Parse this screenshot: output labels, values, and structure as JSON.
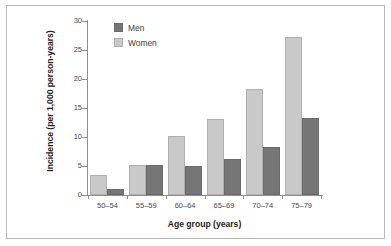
{
  "chart_data": {
    "type": "bar",
    "title": "",
    "xlabel": "Age group (years)",
    "ylabel": "Incidence (per 1,000 person-years)",
    "categories": [
      "50–54",
      "55–59",
      "60–64",
      "65–69",
      "70–74",
      "75–79"
    ],
    "series": [
      {
        "name": "Men",
        "color": "#767676",
        "values": [
          1.0,
          5.1,
          5.0,
          6.2,
          8.2,
          13.2
        ]
      },
      {
        "name": "Women",
        "color": "#c9c9c9",
        "values": [
          3.5,
          5.1,
          10.2,
          13.1,
          18.2,
          27.2
        ]
      }
    ],
    "ylim": [
      0,
      30
    ],
    "yticks": [
      0,
      5,
      10,
      15,
      20,
      25,
      30
    ],
    "ytick_labels": [
      "0",
      "5",
      "10",
      "15",
      "20",
      "25",
      "30"
    ],
    "grid": false,
    "legend_position": "top-left",
    "legend_order": [
      "Men",
      "Women"
    ],
    "bar_order_in_group": [
      "Women",
      "Men"
    ]
  },
  "legend": {
    "items": [
      {
        "label": "Men"
      },
      {
        "label": "Women"
      }
    ]
  },
  "axes": {
    "y_title": "Incidence (per 1,000 person-years)",
    "x_title": "Age group (years)"
  }
}
